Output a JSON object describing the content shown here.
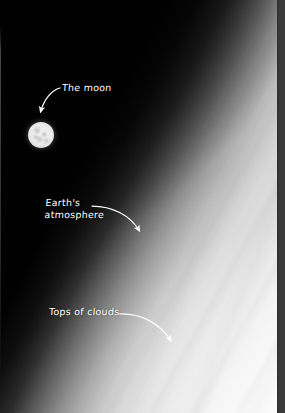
{
  "figure": {
    "name": "earth-limb-and-moon-photograph",
    "width": 285,
    "height": 413
  },
  "annotations": [
    {
      "id": "moon",
      "label": "The moon",
      "lines": [
        "The moon"
      ],
      "text_x": 62,
      "text_y": 82,
      "arrow": {
        "from_x": 60,
        "from_y": 88,
        "to_x": 40,
        "to_y": 115,
        "curve": "convex-up-right"
      }
    },
    {
      "id": "atmosphere",
      "label": "Earth's atmosphere",
      "lines": [
        "Earth's",
        "atmosphere"
      ],
      "text_x": 45,
      "text_y": 197,
      "arrow": {
        "from_x": 92,
        "from_y": 206,
        "to_x": 141,
        "to_y": 234,
        "curve": "convex-up-right"
      }
    },
    {
      "id": "clouds",
      "label": "Tops of clouds",
      "lines": [
        "Tops of clouds"
      ],
      "text_x": 49,
      "text_y": 306,
      "arrow": {
        "from_x": 119,
        "from_y": 314,
        "to_x": 173,
        "to_y": 344,
        "curve": "convex-up-right"
      }
    }
  ],
  "objects": {
    "moon": {
      "name": "moon-disk",
      "center_x": 41,
      "center_y": 135,
      "diameter": 26
    },
    "earth_limb": {
      "name": "earth-limb",
      "orientation": "diagonal-from-lower-left-to-upper-right"
    },
    "space": {
      "name": "deep-space-background"
    }
  },
  "colors": {
    "space_black": "#000000",
    "annotation_white": "#ffffff",
    "moon_white": "#f4f4f4",
    "moon_mare_grey": "#9a9a9a",
    "cloud_white": "#fdfdfd",
    "atmosphere_grey": "#969696",
    "gutter_dark": "#3a3a3a"
  }
}
